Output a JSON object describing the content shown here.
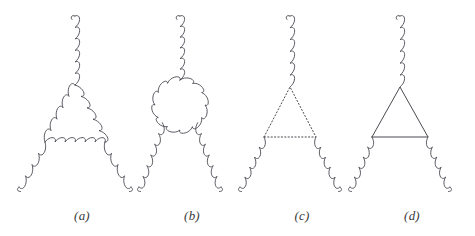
{
  "figure": {
    "background_color": "#ffffff",
    "line_color": "#4a4a52",
    "label_color": "#3a3a3a",
    "width": 475,
    "height": 236,
    "panels": [
      {
        "id": "a",
        "label": "(a)",
        "label_x": 62,
        "label_y": 208,
        "description": "Three-gluon vertex with a gluon triangle loop",
        "loop_type": "gluon-triangle",
        "external_legs": [
          "gluon-top",
          "gluon-bottom-left",
          "gluon-bottom-right"
        ],
        "apex": {
          "x": 75,
          "y": 85
        },
        "bottom_left": {
          "x": 45,
          "y": 142
        },
        "bottom_right": {
          "x": 105,
          "y": 142
        },
        "top_leg_start": {
          "x": 75,
          "y": 16
        },
        "left_leg_end": {
          "x": 19,
          "y": 187
        },
        "right_leg_end": {
          "x": 131,
          "y": 187
        }
      },
      {
        "id": "b",
        "label": "(b)",
        "label_x": 172,
        "label_y": 208,
        "description": "Three-gluon vertex with a closed gluon bubble loop",
        "loop_type": "gluon-circle",
        "external_legs": [
          "gluon-top",
          "gluon-bottom-left",
          "gluon-bottom-right"
        ],
        "circle_center": {
          "x": 180,
          "y": 105
        },
        "circle_radius": 25,
        "top_leg_start": {
          "x": 180,
          "y": 16
        },
        "left_leg_end": {
          "x": 139,
          "y": 187
        },
        "right_leg_end": {
          "x": 221,
          "y": 187
        }
      },
      {
        "id": "c",
        "label": "(c)",
        "label_x": 282,
        "label_y": 208,
        "description": "Three-gluon vertex with a ghost triangle loop (dotted lines)",
        "loop_type": "ghost-triangle-dotted",
        "external_legs": [
          "gluon-top",
          "gluon-bottom-left",
          "gluon-bottom-right"
        ],
        "apex": {
          "x": 290,
          "y": 87
        },
        "bottom_left": {
          "x": 264,
          "y": 137
        },
        "bottom_right": {
          "x": 316,
          "y": 137
        },
        "top_leg_start": {
          "x": 290,
          "y": 16
        },
        "left_leg_end": {
          "x": 240,
          "y": 187
        },
        "right_leg_end": {
          "x": 340,
          "y": 187
        }
      },
      {
        "id": "d",
        "label": "(d)",
        "label_x": 392,
        "label_y": 208,
        "description": "Three-gluon vertex with a quark triangle loop (solid lines)",
        "loop_type": "quark-triangle-solid",
        "external_legs": [
          "gluon-top",
          "gluon-bottom-left",
          "gluon-bottom-right"
        ],
        "apex": {
          "x": 400,
          "y": 87
        },
        "bottom_left": {
          "x": 372,
          "y": 137
        },
        "bottom_right": {
          "x": 428,
          "y": 137
        },
        "top_leg_start": {
          "x": 400,
          "y": 16
        },
        "left_leg_end": {
          "x": 350,
          "y": 187
        },
        "right_leg_end": {
          "x": 450,
          "y": 187
        }
      }
    ]
  }
}
